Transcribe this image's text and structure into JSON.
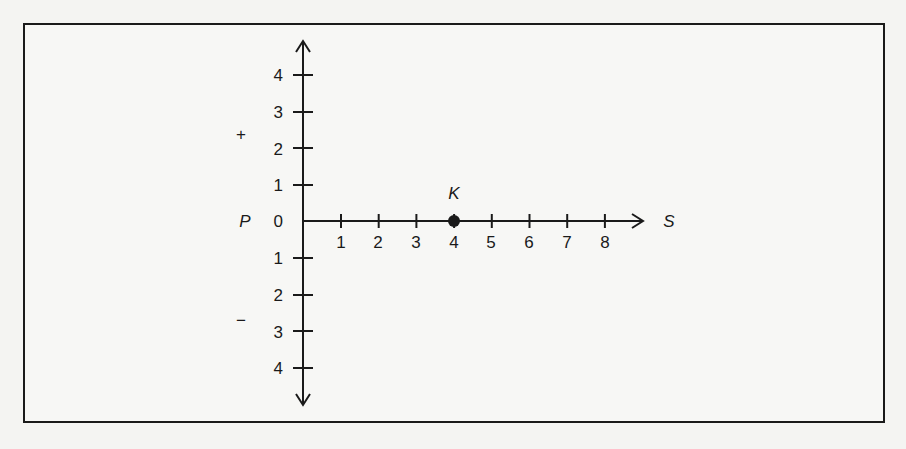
{
  "diagram": {
    "type": "coordinate-axes",
    "horizontal_axis": {
      "label": "S",
      "origin_label": "0",
      "ticks": [
        "1",
        "2",
        "3",
        "4",
        "5",
        "6",
        "7",
        "8"
      ]
    },
    "vertical_axis": {
      "label": "P",
      "positive_ticks": [
        "1",
        "2",
        "3",
        "4"
      ],
      "negative_ticks": [
        "1",
        "2",
        "3",
        "4"
      ],
      "positive_sign": "+",
      "negative_sign": "−"
    },
    "points": [
      {
        "label": "K",
        "x": 4,
        "y": 0
      }
    ],
    "colors": {
      "ink": "#1a1a1a",
      "paper": "#f7f7f5"
    }
  }
}
